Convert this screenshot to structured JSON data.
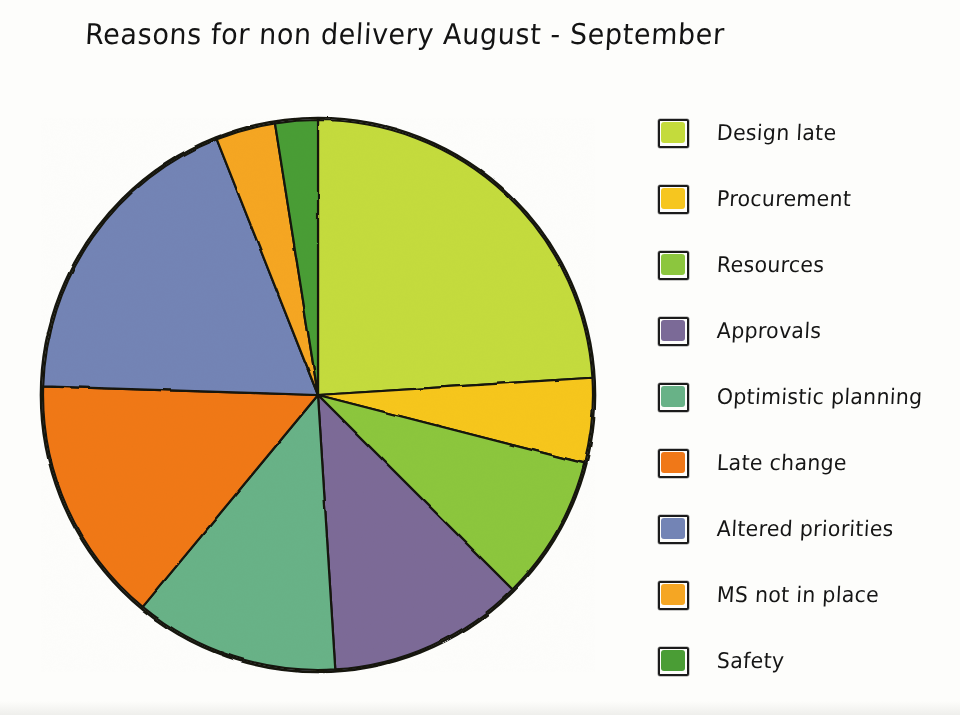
{
  "title": "Reasons for non delivery August - September",
  "chart_data": {
    "type": "pie",
    "title": "Reasons for non delivery August - September",
    "xlabel": "",
    "ylabel": "",
    "legend_position": "right",
    "grid": false,
    "start_angle_deg": 0,
    "direction": "clockwise",
    "categories": [
      "Design late",
      "Procurement",
      "Resources",
      "Approvals",
      "Optimistic planning",
      "Late change",
      "Altered priorities",
      "MS not in place",
      "Safety"
    ],
    "values": [
      24.0,
      5.0,
      8.5,
      11.5,
      12.0,
      14.5,
      18.5,
      3.5,
      2.5
    ],
    "units": "percent",
    "colors": [
      "#c4db3c",
      "#f6c61f",
      "#8cc63e",
      "#7b6a97",
      "#68b287",
      "#f07818",
      "#7384b5",
      "#f5a623",
      "#4a9d35"
    ],
    "slices": [
      {
        "label": "Design late",
        "value": 24.0,
        "color": "#c4db3c",
        "start_deg": 0.0,
        "end_deg": 86.4
      },
      {
        "label": "Procurement",
        "value": 5.0,
        "color": "#f6c61f",
        "start_deg": 86.4,
        "end_deg": 104.4
      },
      {
        "label": "Resources",
        "value": 8.5,
        "color": "#8cc63e",
        "start_deg": 104.4,
        "end_deg": 135.0
      },
      {
        "label": "Approvals",
        "value": 11.5,
        "color": "#7b6a97",
        "start_deg": 135.0,
        "end_deg": 176.4
      },
      {
        "label": "Optimistic planning",
        "value": 12.0,
        "color": "#68b287",
        "start_deg": 176.4,
        "end_deg": 219.6
      },
      {
        "label": "Late change",
        "value": 14.5,
        "color": "#f07818",
        "start_deg": 219.6,
        "end_deg": 271.8
      },
      {
        "label": "Altered priorities",
        "value": 18.5,
        "color": "#7384b5",
        "start_deg": 271.8,
        "end_deg": 338.4
      },
      {
        "label": "MS not in place",
        "value": 3.5,
        "color": "#f5a623",
        "start_deg": 338.4,
        "end_deg": 351.0
      },
      {
        "label": "Safety",
        "value": 2.5,
        "color": "#4a9d35",
        "start_deg": 351.0,
        "end_deg": 360.0
      }
    ]
  },
  "legend": {
    "items": [
      {
        "label": "Design late",
        "color": "#c4db3c"
      },
      {
        "label": "Procurement",
        "color": "#f6c61f"
      },
      {
        "label": "Resources",
        "color": "#8cc63e"
      },
      {
        "label": "Approvals",
        "color": "#7b6a97"
      },
      {
        "label": "Optimistic planning",
        "color": "#68b287"
      },
      {
        "label": "Late change",
        "color": "#f07818"
      },
      {
        "label": "Altered priorities",
        "color": "#7384b5"
      },
      {
        "label": "MS not in place",
        "color": "#f5a623"
      },
      {
        "label": "Safety",
        "color": "#4a9d35"
      }
    ]
  }
}
